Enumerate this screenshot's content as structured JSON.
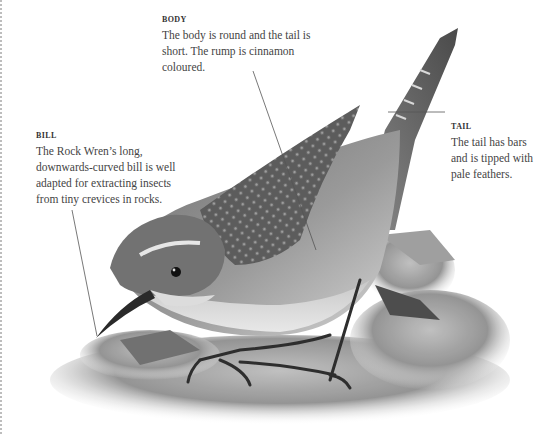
{
  "illustration": {
    "subject": "Rock Wren",
    "alt": "Black-and-white illustration of a Rock Wren perched on rocks, tail raised"
  },
  "annotations": [
    {
      "id": "body",
      "title": "BODY",
      "text": "The body is round and the tail is short. The rump is cinnamon coloured."
    },
    {
      "id": "tail",
      "title": "TAIL",
      "text": "The tail has bars and is tipped with pale feathers."
    },
    {
      "id": "bill",
      "title": "BILL",
      "text": "The Rock Wren’s long, downwards-curved bill is well adapted for extracting insects from tiny crevices in rocks."
    }
  ],
  "colors": {
    "leader_line": "#555555",
    "text": "#444444",
    "page_edge_dots": "#bdbdbd"
  }
}
